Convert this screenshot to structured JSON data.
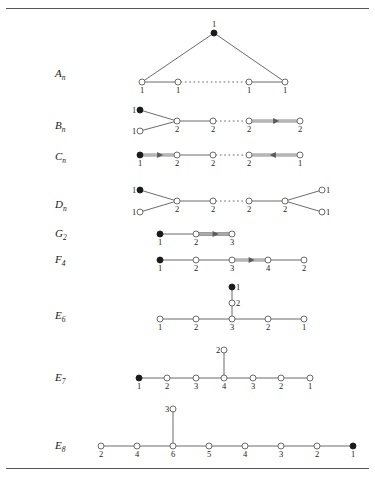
{
  "figure": {
    "kind": "affine-dynkin-diagrams",
    "rules": [
      "top-rule",
      "bottom-rule"
    ]
  },
  "rows": [
    {
      "id": "A_n",
      "label_base": "A",
      "label_sub": "n",
      "label_x": 55,
      "label_y": 76,
      "nodes": [
        {
          "id": "a0",
          "x": 214,
          "y": 33,
          "filled": true,
          "mult": "1",
          "mult_pos": "top"
        },
        {
          "id": "a1",
          "x": 142,
          "y": 82,
          "filled": false,
          "mult": "1",
          "mult_pos": "bottom"
        },
        {
          "id": "a2",
          "x": 178,
          "y": 82,
          "filled": false,
          "mult": "1",
          "mult_pos": "bottom"
        },
        {
          "id": "a3",
          "x": 249,
          "y": 82,
          "filled": false,
          "mult": "1",
          "mult_pos": "bottom"
        },
        {
          "id": "a4",
          "x": 285,
          "y": 82,
          "filled": false,
          "mult": "1",
          "mult_pos": "bottom"
        }
      ],
      "edges": [
        {
          "from": "a0",
          "to": "a1",
          "type": "single"
        },
        {
          "from": "a0",
          "to": "a4",
          "type": "single"
        },
        {
          "from": "a1",
          "to": "a2",
          "type": "single"
        },
        {
          "from": "a2",
          "to": "a3",
          "type": "dotted"
        },
        {
          "from": "a3",
          "to": "a4",
          "type": "single"
        }
      ]
    },
    {
      "id": "B_n",
      "label_base": "B",
      "label_sub": "n",
      "label_x": 55,
      "label_y": 128,
      "nodes": [
        {
          "id": "b0",
          "x": 140,
          "y": 110,
          "filled": true,
          "mult": "1",
          "mult_pos": "left"
        },
        {
          "id": "b1",
          "x": 140,
          "y": 131,
          "filled": false,
          "mult": "1",
          "mult_pos": "left"
        },
        {
          "id": "b2",
          "x": 177,
          "y": 121,
          "filled": false,
          "mult": "2",
          "mult_pos": "bottom"
        },
        {
          "id": "b3",
          "x": 213,
          "y": 121,
          "filled": false,
          "mult": "2",
          "mult_pos": "bottom"
        },
        {
          "id": "b4",
          "x": 249,
          "y": 121,
          "filled": false,
          "mult": "2",
          "mult_pos": "bottom"
        },
        {
          "id": "b5",
          "x": 300,
          "y": 121,
          "filled": false,
          "mult": "2",
          "mult_pos": "bottom"
        }
      ],
      "edges": [
        {
          "from": "b0",
          "to": "b2",
          "type": "single"
        },
        {
          "from": "b1",
          "to": "b2",
          "type": "single"
        },
        {
          "from": "b2",
          "to": "b3",
          "type": "single"
        },
        {
          "from": "b3",
          "to": "b4",
          "type": "dotted"
        },
        {
          "from": "b4",
          "to": "b5",
          "type": "double",
          "arrow": "right"
        }
      ]
    },
    {
      "id": "C_n",
      "label_base": "C",
      "label_sub": "n",
      "label_x": 55,
      "label_y": 159,
      "nodes": [
        {
          "id": "c0",
          "x": 140,
          "y": 155,
          "filled": true,
          "mult": "1",
          "mult_pos": "bottom"
        },
        {
          "id": "c1",
          "x": 177,
          "y": 155,
          "filled": false,
          "mult": "2",
          "mult_pos": "bottom"
        },
        {
          "id": "c2",
          "x": 213,
          "y": 155,
          "filled": false,
          "mult": "2",
          "mult_pos": "bottom"
        },
        {
          "id": "c3",
          "x": 249,
          "y": 155,
          "filled": false,
          "mult": "2",
          "mult_pos": "bottom"
        },
        {
          "id": "c4",
          "x": 300,
          "y": 155,
          "filled": false,
          "mult": "1",
          "mult_pos": "bottom"
        }
      ],
      "edges": [
        {
          "from": "c0",
          "to": "c1",
          "type": "double",
          "arrow": "right"
        },
        {
          "from": "c1",
          "to": "c2",
          "type": "single"
        },
        {
          "from": "c2",
          "to": "c3",
          "type": "dotted"
        },
        {
          "from": "c3",
          "to": "c4",
          "type": "double",
          "arrow": "left"
        }
      ]
    },
    {
      "id": "D_n",
      "label_base": "D",
      "label_sub": "n",
      "label_x": 55,
      "label_y": 207,
      "nodes": [
        {
          "id": "d0",
          "x": 140,
          "y": 190,
          "filled": true,
          "mult": "1",
          "mult_pos": "left"
        },
        {
          "id": "d1",
          "x": 140,
          "y": 212,
          "filled": false,
          "mult": "1",
          "mult_pos": "left"
        },
        {
          "id": "d2",
          "x": 177,
          "y": 201,
          "filled": false,
          "mult": "2",
          "mult_pos": "bottom"
        },
        {
          "id": "d3",
          "x": 213,
          "y": 201,
          "filled": false,
          "mult": "2",
          "mult_pos": "bottom"
        },
        {
          "id": "d4",
          "x": 249,
          "y": 201,
          "filled": false,
          "mult": "2",
          "mult_pos": "bottom"
        },
        {
          "id": "d5",
          "x": 285,
          "y": 201,
          "filled": false,
          "mult": "2",
          "mult_pos": "bottom"
        },
        {
          "id": "d6",
          "x": 322,
          "y": 190,
          "filled": false,
          "mult": "1",
          "mult_pos": "right"
        },
        {
          "id": "d7",
          "x": 322,
          "y": 212,
          "filled": false,
          "mult": "1",
          "mult_pos": "right"
        }
      ],
      "edges": [
        {
          "from": "d0",
          "to": "d2",
          "type": "single"
        },
        {
          "from": "d1",
          "to": "d2",
          "type": "single"
        },
        {
          "from": "d2",
          "to": "d3",
          "type": "single"
        },
        {
          "from": "d3",
          "to": "d4",
          "type": "dotted"
        },
        {
          "from": "d4",
          "to": "d5",
          "type": "single"
        },
        {
          "from": "d5",
          "to": "d6",
          "type": "single"
        },
        {
          "from": "d5",
          "to": "d7",
          "type": "single"
        }
      ]
    },
    {
      "id": "G_2",
      "label_base": "G",
      "label_sub": "2",
      "label_x": 55,
      "label_y": 236,
      "nodes": [
        {
          "id": "g0",
          "x": 160,
          "y": 234,
          "filled": true,
          "mult": "1",
          "mult_pos": "bottom"
        },
        {
          "id": "g1",
          "x": 196,
          "y": 234,
          "filled": false,
          "mult": "2",
          "mult_pos": "bottom"
        },
        {
          "id": "g2",
          "x": 232,
          "y": 234,
          "filled": false,
          "mult": "3",
          "mult_pos": "bottom"
        }
      ],
      "edges": [
        {
          "from": "g0",
          "to": "g1",
          "type": "single"
        },
        {
          "from": "g1",
          "to": "g2",
          "type": "triple",
          "arrow": "right"
        }
      ]
    },
    {
      "id": "F_4",
      "label_base": "F",
      "label_sub": "4",
      "label_x": 55,
      "label_y": 262,
      "nodes": [
        {
          "id": "f0",
          "x": 160,
          "y": 260,
          "filled": true,
          "mult": "1",
          "mult_pos": "bottom"
        },
        {
          "id": "f1",
          "x": 196,
          "y": 260,
          "filled": false,
          "mult": "2",
          "mult_pos": "bottom"
        },
        {
          "id": "f2",
          "x": 232,
          "y": 260,
          "filled": false,
          "mult": "3",
          "mult_pos": "bottom"
        },
        {
          "id": "f3",
          "x": 268,
          "y": 260,
          "filled": false,
          "mult": "4",
          "mult_pos": "bottom"
        },
        {
          "id": "f4",
          "x": 304,
          "y": 260,
          "filled": false,
          "mult": "2",
          "mult_pos": "bottom"
        }
      ],
      "edges": [
        {
          "from": "f0",
          "to": "f1",
          "type": "single"
        },
        {
          "from": "f1",
          "to": "f2",
          "type": "single"
        },
        {
          "from": "f2",
          "to": "f3",
          "type": "double",
          "arrow": "right"
        },
        {
          "from": "f3",
          "to": "f4",
          "type": "single"
        }
      ]
    },
    {
      "id": "E_6",
      "label_base": "E",
      "label_sub": "6",
      "label_x": 55,
      "label_y": 318,
      "nodes": [
        {
          "id": "e60",
          "x": 232,
          "y": 287,
          "filled": true,
          "mult": "1",
          "mult_pos": "right"
        },
        {
          "id": "e61",
          "x": 232,
          "y": 303,
          "filled": false,
          "mult": "2",
          "mult_pos": "right"
        },
        {
          "id": "e62",
          "x": 160,
          "y": 319,
          "filled": false,
          "mult": "1",
          "mult_pos": "bottom"
        },
        {
          "id": "e63",
          "x": 196,
          "y": 319,
          "filled": false,
          "mult": "2",
          "mult_pos": "bottom"
        },
        {
          "id": "e64",
          "x": 232,
          "y": 319,
          "filled": false,
          "mult": "3",
          "mult_pos": "bottom"
        },
        {
          "id": "e65",
          "x": 268,
          "y": 319,
          "filled": false,
          "mult": "2",
          "mult_pos": "bottom"
        },
        {
          "id": "e66",
          "x": 304,
          "y": 319,
          "filled": false,
          "mult": "1",
          "mult_pos": "bottom"
        }
      ],
      "edges": [
        {
          "from": "e60",
          "to": "e61",
          "type": "single"
        },
        {
          "from": "e61",
          "to": "e64",
          "type": "single"
        },
        {
          "from": "e62",
          "to": "e63",
          "type": "single"
        },
        {
          "from": "e63",
          "to": "e64",
          "type": "single"
        },
        {
          "from": "e64",
          "to": "e65",
          "type": "single"
        },
        {
          "from": "e65",
          "to": "e66",
          "type": "single"
        }
      ]
    },
    {
      "id": "E_7",
      "label_base": "E",
      "label_sub": "7",
      "label_x": 55,
      "label_y": 380,
      "nodes": [
        {
          "id": "e70",
          "x": 224,
          "y": 350,
          "filled": false,
          "mult": "2",
          "mult_pos": "left"
        },
        {
          "id": "e71",
          "x": 139,
          "y": 378,
          "filled": true,
          "mult": "1",
          "mult_pos": "bottom"
        },
        {
          "id": "e72",
          "x": 167,
          "y": 378,
          "filled": false,
          "mult": "2",
          "mult_pos": "bottom"
        },
        {
          "id": "e73",
          "x": 196,
          "y": 378,
          "filled": false,
          "mult": "3",
          "mult_pos": "bottom"
        },
        {
          "id": "e74",
          "x": 224,
          "y": 378,
          "filled": false,
          "mult": "4",
          "mult_pos": "bottom"
        },
        {
          "id": "e75",
          "x": 253,
          "y": 378,
          "filled": false,
          "mult": "3",
          "mult_pos": "bottom"
        },
        {
          "id": "e76",
          "x": 281,
          "y": 378,
          "filled": false,
          "mult": "2",
          "mult_pos": "bottom"
        },
        {
          "id": "e77",
          "x": 310,
          "y": 378,
          "filled": false,
          "mult": "1",
          "mult_pos": "bottom"
        }
      ],
      "edges": [
        {
          "from": "e70",
          "to": "e74",
          "type": "single"
        },
        {
          "from": "e71",
          "to": "e72",
          "type": "single"
        },
        {
          "from": "e72",
          "to": "e73",
          "type": "single"
        },
        {
          "from": "e73",
          "to": "e74",
          "type": "single"
        },
        {
          "from": "e74",
          "to": "e75",
          "type": "single"
        },
        {
          "from": "e75",
          "to": "e76",
          "type": "single"
        },
        {
          "from": "e76",
          "to": "e77",
          "type": "single"
        }
      ]
    },
    {
      "id": "E_8",
      "label_base": "E",
      "label_sub": "8",
      "label_x": 55,
      "label_y": 448,
      "nodes": [
        {
          "id": "e80",
          "x": 173,
          "y": 409,
          "filled": false,
          "mult": "3",
          "mult_pos": "left"
        },
        {
          "id": "e81",
          "x": 101,
          "y": 446,
          "filled": false,
          "mult": "2",
          "mult_pos": "bottom"
        },
        {
          "id": "e82",
          "x": 137,
          "y": 446,
          "filled": false,
          "mult": "4",
          "mult_pos": "bottom"
        },
        {
          "id": "e83",
          "x": 173,
          "y": 446,
          "filled": false,
          "mult": "6",
          "mult_pos": "bottom"
        },
        {
          "id": "e84",
          "x": 209,
          "y": 446,
          "filled": false,
          "mult": "5",
          "mult_pos": "bottom"
        },
        {
          "id": "e85",
          "x": 245,
          "y": 446,
          "filled": false,
          "mult": "4",
          "mult_pos": "bottom"
        },
        {
          "id": "e86",
          "x": 281,
          "y": 446,
          "filled": false,
          "mult": "3",
          "mult_pos": "bottom"
        },
        {
          "id": "e87",
          "x": 317,
          "y": 446,
          "filled": false,
          "mult": "2",
          "mult_pos": "bottom"
        },
        {
          "id": "e88",
          "x": 353,
          "y": 446,
          "filled": true,
          "mult": "1",
          "mult_pos": "bottom"
        }
      ],
      "edges": [
        {
          "from": "e80",
          "to": "e83",
          "type": "single"
        },
        {
          "from": "e81",
          "to": "e82",
          "type": "single"
        },
        {
          "from": "e82",
          "to": "e83",
          "type": "single"
        },
        {
          "from": "e83",
          "to": "e84",
          "type": "single"
        },
        {
          "from": "e84",
          "to": "e85",
          "type": "single"
        },
        {
          "from": "e85",
          "to": "e86",
          "type": "single"
        },
        {
          "from": "e86",
          "to": "e87",
          "type": "single"
        },
        {
          "from": "e87",
          "to": "e88",
          "type": "single"
        }
      ]
    }
  ],
  "style": {
    "line_color": "#5a5a5a",
    "node_stroke": "#5a5a5a",
    "node_fill_open": "#ffffff",
    "node_fill_closed": "#1a1a1a",
    "text_color": "#222222",
    "rule_color": "#555555"
  }
}
